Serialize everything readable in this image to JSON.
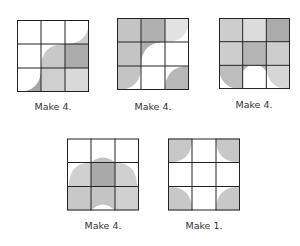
{
  "colors": {
    "white": "#ffffff",
    "light": "#d9d9d9",
    "mid": "#c4c4c4",
    "dark": "#a9a9a9",
    "line": "#222222"
  },
  "blocks": [
    {
      "id": "block-1",
      "label": "Make 4."
    },
    {
      "id": "block-2",
      "label": "Make 4."
    },
    {
      "id": "block-3",
      "label": "Make 4."
    },
    {
      "id": "block-4",
      "label": "Make 4."
    },
    {
      "id": "block-5",
      "label": "Make 1."
    }
  ]
}
